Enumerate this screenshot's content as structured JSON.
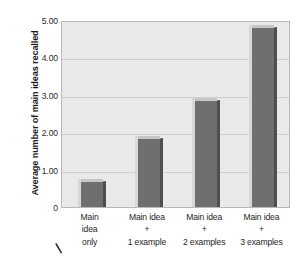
{
  "chart_data": {
    "type": "bar",
    "title": "",
    "xlabel": "",
    "ylabel": "Average number of main ideas recalled",
    "categories": [
      "Main idea only",
      "Main idea + 1 example",
      "Main idea + 2 examples",
      "Main idea + 3 examples"
    ],
    "category_lines": [
      [
        "Main",
        "idea",
        "only"
      ],
      [
        "Main idea",
        "+",
        "1 example"
      ],
      [
        "Main idea",
        "+",
        "2 examples"
      ],
      [
        "Main idea",
        "+",
        "3 examples"
      ]
    ],
    "values": [
      0.7,
      1.85,
      2.85,
      4.8
    ],
    "ylim": [
      0,
      5
    ],
    "yticks": [
      0,
      1,
      2,
      3,
      4,
      5
    ],
    "ytick_labels": [
      "0",
      "1.00",
      "2.00",
      "3.00",
      "4.00",
      "5.00"
    ],
    "grid": true,
    "legend": "none",
    "bar_color": "#6f6f6f",
    "plot_background": "#e9e9e9",
    "gridline_color": "#cfcfcf"
  },
  "figure": {
    "y_axis_title": "Average number of main ideas recalled",
    "pen_mark": "stray-diagonal-mark"
  }
}
